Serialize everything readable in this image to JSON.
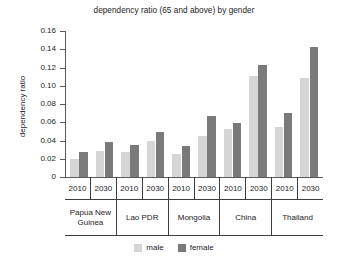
{
  "chart_data": {
    "type": "bar",
    "title": "dependency ratio (65 and above) by gender",
    "xlabel": "",
    "ylabel": "dependency ratio",
    "ylim": [
      0,
      0.16
    ],
    "ytick_labels": [
      "0.16",
      "0.14",
      "0.12",
      "0.10",
      "0.08",
      "0.06",
      "0.04",
      "0.02",
      "0"
    ],
    "ytick_values": [
      0.16,
      0.14,
      0.12,
      0.1,
      0.08,
      0.06,
      0.04,
      0.02,
      0
    ],
    "grid": false,
    "legend_position": "bottom",
    "groups": [
      "Papua New Guinea",
      "Lao PDR",
      "Mongolia",
      "China",
      "Thailand"
    ],
    "years": [
      "2010",
      "2030"
    ],
    "categories": [
      "Papua New Guinea 2010",
      "Papua New Guinea 2030",
      "Lao PDR 2010",
      "Lao PDR 2030",
      "Mongolia 2010",
      "Mongolia 2030",
      "China 2010",
      "China 2030",
      "Thailand 2010",
      "Thailand 2030"
    ],
    "series": [
      {
        "name": "male",
        "color": "#d6d6d6",
        "values": [
          0.02,
          0.028,
          0.027,
          0.04,
          0.025,
          0.045,
          0.053,
          0.111,
          0.055,
          0.109
        ]
      },
      {
        "name": "female",
        "color": "#7a7a7a",
        "values": [
          0.027,
          0.038,
          0.035,
          0.049,
          0.034,
          0.067,
          0.059,
          0.123,
          0.07,
          0.143
        ]
      }
    ]
  },
  "legend": {
    "items": [
      {
        "label": "male",
        "color": "#d6d6d6"
      },
      {
        "label": "female",
        "color": "#7a7a7a"
      }
    ]
  },
  "x_axis": {
    "year_cells": [
      "2010",
      "2030",
      "2010",
      "2030",
      "2010",
      "2030",
      "2010",
      "2030",
      "2010",
      "2030"
    ],
    "country_cells": [
      "Papua New Guinea",
      "Lao PDR",
      "Mongolia",
      "China",
      "Thailand"
    ]
  }
}
